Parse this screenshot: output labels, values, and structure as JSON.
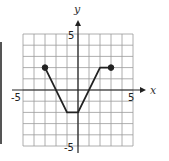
{
  "chart_data": {
    "type": "line",
    "title": "",
    "xlabel": "x",
    "ylabel": "y",
    "xlim": [
      -5,
      5
    ],
    "ylim": [
      -5,
      5
    ],
    "grid": true,
    "tick_labels": {
      "x_min": "-5",
      "x_max": "5",
      "y_min": "-5",
      "y_max": "5"
    },
    "series": [
      {
        "name": "f",
        "x": [
          -3,
          -1,
          0,
          2,
          3
        ],
        "y": [
          2,
          -2,
          -2,
          2,
          2
        ],
        "endpoints": [
          {
            "x": -3,
            "y": 2,
            "style": "closed"
          },
          {
            "x": 3,
            "y": 2,
            "style": "closed"
          }
        ]
      }
    ]
  },
  "colors": {
    "grid": "#9a9a9a",
    "axis": "#222222",
    "line": "#222222"
  }
}
